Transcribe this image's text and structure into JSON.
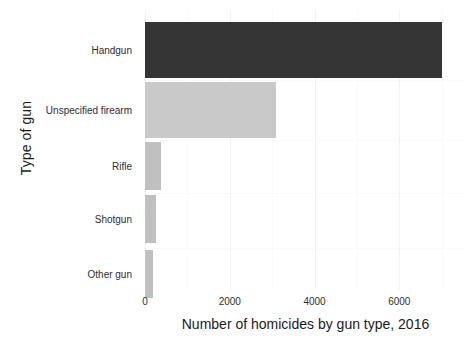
{
  "chart_data": {
    "type": "bar",
    "orientation": "horizontal",
    "title": "",
    "xlabel": "Number of homicides by gun type, 2016",
    "ylabel": "Type of gun",
    "categories": [
      "Handgun",
      "Unspecified firearm",
      "Rifle",
      "Shotgun",
      "Other gun"
    ],
    "values": [
      7000,
      3100,
      375,
      265,
      190
    ],
    "series": [
      {
        "name": "Number of homicides by gun type, 2016",
        "values": [
          7000,
          3100,
          375,
          265,
          190
        ]
      }
    ],
    "xlim": [
      0,
      7550
    ],
    "xticks": [
      0,
      2000,
      4000,
      6000
    ],
    "xtick_labels": [
      "0",
      "2000",
      "4000",
      "6000"
    ],
    "ytick_labels": [
      "Handgun",
      "Unspecified firearm",
      "Rifle",
      "Shotgun",
      "Other gun"
    ],
    "bar_colors": [
      "#353535",
      "#c9c9c9",
      "#c0c0c0",
      "#c0c0c0",
      "#c0c0c0"
    ],
    "grid": true,
    "grid_color": "#f2f2f2",
    "legend": false,
    "background": "#ffffff"
  },
  "axis": {
    "y_title": "Type of gun",
    "x_title": "Number of homicides by gun type, 2016"
  },
  "bars": [
    {
      "label": "Handgun",
      "value": 7000,
      "color": "#353535",
      "top": 12,
      "height": 56
    },
    {
      "label": "Unspecified firearm",
      "value": 3100,
      "color": "#c9c9c9",
      "top": 72,
      "height": 56
    },
    {
      "label": "Rifle",
      "value": 375,
      "color": "#c0c0c0",
      "top": 132,
      "height": 48
    },
    {
      "label": "Shotgun",
      "value": 265,
      "color": "#c0c0c0",
      "top": 185,
      "height": 48
    },
    {
      "label": "Other gun",
      "value": 190,
      "color": "#c0c0c0",
      "top": 240,
      "height": 48
    }
  ],
  "xticks": [
    {
      "label": "0",
      "value": 0
    },
    {
      "label": "2000",
      "value": 2000
    },
    {
      "label": "4000",
      "value": 4000
    },
    {
      "label": "6000",
      "value": 6000
    }
  ]
}
